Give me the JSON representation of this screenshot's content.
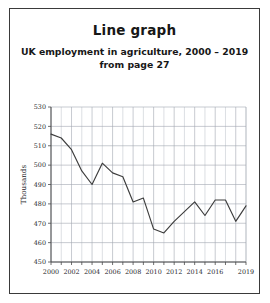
{
  "card": {
    "title": "Line graph",
    "subtitle_line1": "UK employment in agriculture, 2000 – 2019",
    "subtitle_line2": "from page 27"
  },
  "chart_data": {
    "type": "line",
    "title": "Line graph",
    "subtitle": "UK employment in agriculture, 2000 – 2019 from page 27",
    "xlabel": "",
    "ylabel": "Thousands",
    "xlim": [
      2000,
      2019
    ],
    "ylim": [
      450,
      530
    ],
    "ytick_step": 10,
    "grid": true,
    "legend": "none",
    "line_color": "#3d3d3d",
    "x": [
      2000,
      2001,
      2002,
      2003,
      2004,
      2005,
      2006,
      2007,
      2008,
      2009,
      2010,
      2011,
      2012,
      2013,
      2014,
      2015,
      2016,
      2017,
      2018,
      2019
    ],
    "values": [
      516,
      514,
      508,
      497,
      490,
      501,
      496,
      494,
      481,
      483,
      467,
      465,
      471,
      476,
      481,
      474,
      482,
      482,
      471,
      479
    ],
    "ytick_labels": [
      "450",
      "460",
      "470",
      "480",
      "490",
      "500",
      "510",
      "520",
      "530"
    ],
    "xtick_labels": [
      "2000",
      "2002",
      "2004",
      "2006",
      "2008",
      "2010",
      "2012",
      "2014",
      "2016",
      "2019"
    ]
  }
}
